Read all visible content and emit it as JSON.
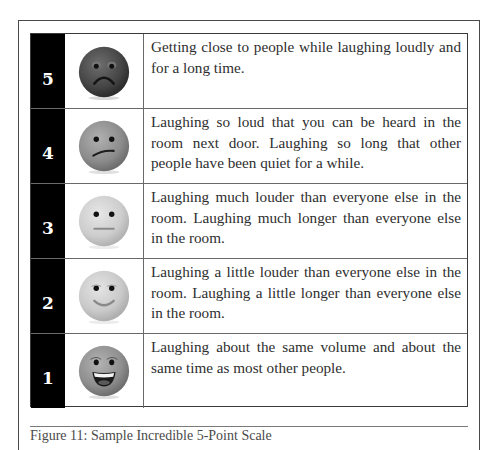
{
  "scale": {
    "rows": [
      {
        "rating": "5",
        "face": "sad-face-icon",
        "face_color": "#4a4a4a",
        "description": "Getting close to people while laughing loudly and for a long time."
      },
      {
        "rating": "4",
        "face": "uneasy-face-icon",
        "face_color": "#8c8c8c",
        "description": "Laughing so loud that you can be heard in the room next door. Laughing so long that other people have been quiet for a while."
      },
      {
        "rating": "3",
        "face": "neutral-face-icon",
        "face_color": "#cdcdcd",
        "description": "Laughing much louder than everyone else in the room. Laughing much longer than everyone else in the room."
      },
      {
        "rating": "2",
        "face": "smiling-face-icon",
        "face_color": "#c9c9c9",
        "description": "Laughing a little louder than everyone else in the room. Laughing a little longer than everyone else in the room."
      },
      {
        "rating": "1",
        "face": "grinning-face-icon",
        "face_color": "#8e8e8e",
        "description": "Laughing about the same volume and about the same time as most other people."
      }
    ]
  },
  "caption": "Figure 11: Sample Incredible 5-Point Scale"
}
